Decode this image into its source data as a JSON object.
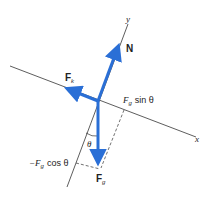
{
  "diagram": {
    "type": "free-body diagram",
    "colors": {
      "vector": "#2a6fd6",
      "axis": "#333333",
      "text": "#222222",
      "background": "#ffffff"
    },
    "axes": {
      "x_label": "x",
      "y_label": "y"
    },
    "vectors": {
      "normal": {
        "label": "N"
      },
      "friction": {
        "label_main": "F",
        "label_sub": "k"
      },
      "gravity": {
        "label_main": "F",
        "label_sub": "g"
      }
    },
    "components": {
      "parallel": {
        "prefix": "F",
        "sub": "g",
        "suffix": "sin θ"
      },
      "perpendicular": {
        "prefix": "−F",
        "sub": "g",
        "suffix": "cos θ"
      }
    },
    "angle_label": "θ"
  }
}
